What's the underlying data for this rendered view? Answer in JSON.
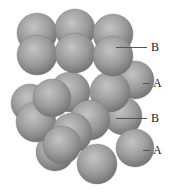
{
  "figure": {
    "sphere_color": "#9a9a9a",
    "highlight_color": "#d8d8d8",
    "shadow_color": "#5a5a5a"
  },
  "labels": [
    {
      "text": "B",
      "x": 151,
      "y": 41,
      "line_x1": 116,
      "line_x2": 147,
      "line_y": 47
    },
    {
      "text": "A",
      "x": 153,
      "y": 77,
      "line_x1": 143,
      "line_x2": 150,
      "line_y": 83
    },
    {
      "text": "B",
      "x": 151,
      "y": 112,
      "line_x1": 116,
      "line_x2": 147,
      "line_y": 118
    },
    {
      "text": "A",
      "x": 153,
      "y": 144,
      "line_x1": 143,
      "line_x2": 150,
      "line_y": 150
    }
  ],
  "spheres": [
    [
      135,
      80,
      19
    ],
    [
      30,
      103,
      19
    ],
    [
      123,
      116,
      19
    ],
    [
      37,
      33,
      20
    ],
    [
      75,
      29,
      20
    ],
    [
      113,
      34,
      20
    ],
    [
      135,
      148,
      19
    ],
    [
      55,
      152,
      19
    ],
    [
      97,
      164,
      20
    ],
    [
      37,
      55,
      20
    ],
    [
      70,
      92,
      20
    ],
    [
      110,
      92,
      20
    ],
    [
      75,
      53,
      20
    ],
    [
      36,
      122,
      20
    ],
    [
      113,
      56,
      20
    ],
    [
      52,
      98,
      19
    ],
    [
      90,
      120,
      20
    ],
    [
      72,
      133,
      20
    ],
    [
      62,
      145,
      19
    ]
  ]
}
